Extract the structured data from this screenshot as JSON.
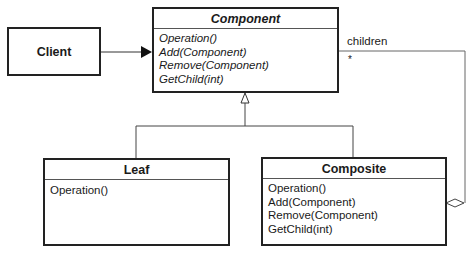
{
  "diagram": {
    "type": "UML class diagram",
    "classes": {
      "client": {
        "name": "Client"
      },
      "component": {
        "name": "Component",
        "abstract": true,
        "operations": [
          "Operation()",
          "Add(Component)",
          "Remove(Component)",
          "GetChild(int)"
        ]
      },
      "leaf": {
        "name": "Leaf",
        "operations": [
          "Operation()"
        ]
      },
      "composite": {
        "name": "Composite",
        "operations": [
          "Operation()",
          "Add(Component)",
          "Remove(Component)",
          "GetChild(int)"
        ]
      }
    },
    "relations": {
      "association": {
        "from": "Client",
        "to": "Component"
      },
      "inheritance": {
        "children": [
          "Leaf",
          "Composite"
        ],
        "parent": "Component"
      },
      "aggregation": {
        "from": "Composite",
        "to": "Component",
        "role": "children",
        "multiplicity": "*"
      }
    }
  }
}
